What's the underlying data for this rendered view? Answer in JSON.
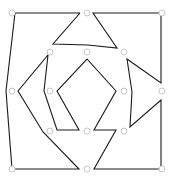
{
  "diagram": {
    "type": "polygon-tiling",
    "width": 169,
    "height": 184,
    "colors": {
      "edge": "#1a1a1a",
      "node_stroke": "#c8c8c8",
      "node_fill": "#ffffff",
      "background": "#ffffff"
    },
    "node_radius": 3,
    "nodes": [
      {
        "id": "n-top-left",
        "x": 12,
        "y": 13
      },
      {
        "id": "n-top-center",
        "x": 87,
        "y": 13
      },
      {
        "id": "n-top-right",
        "x": 162,
        "y": 13
      },
      {
        "id": "n-upper-left-inner",
        "x": 50,
        "y": 52
      },
      {
        "id": "n-upper-center",
        "x": 87,
        "y": 52
      },
      {
        "id": "n-upper-right-inner",
        "x": 124,
        "y": 52
      },
      {
        "id": "n-mid-left",
        "x": 12,
        "y": 91
      },
      {
        "id": "n-mid-left-inner",
        "x": 50,
        "y": 91
      },
      {
        "id": "n-mid-right-inner",
        "x": 124,
        "y": 91
      },
      {
        "id": "n-mid-right",
        "x": 162,
        "y": 91
      },
      {
        "id": "n-lower-left-inner",
        "x": 50,
        "y": 131
      },
      {
        "id": "n-lower-center",
        "x": 87,
        "y": 131
      },
      {
        "id": "n-lower-right-inner",
        "x": 124,
        "y": 131
      },
      {
        "id": "n-bottom-left",
        "x": 12,
        "y": 169
      },
      {
        "id": "n-bottom-center",
        "x": 87,
        "y": 169
      },
      {
        "id": "n-bottom-right",
        "x": 162,
        "y": 169
      }
    ],
    "polylines": [
      {
        "id": "top-left-frame",
        "points": "80,13 15,13 6,91 12,169 79,169 43,132 18,91 48,55 44,91 57,130 79,130 57,91 87,59 116,91 94,130 116,130 94,169 161,169 161,100 130,127 132,92 127,59 161,83 161,13 93,13 117,48 88,45 53,44 80,13"
      }
    ]
  }
}
